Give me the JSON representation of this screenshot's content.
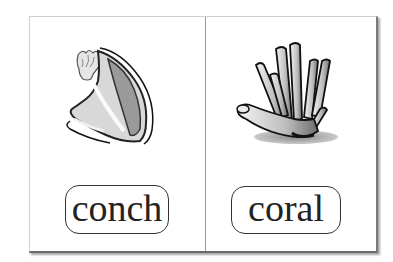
{
  "cards": [
    {
      "word": "conch",
      "illustration": "conch-shell"
    },
    {
      "word": "coral",
      "illustration": "coral"
    }
  ],
  "colors": {
    "border_light": "#cfcfcf",
    "border_dark": "#6a6a6a",
    "text": "#222222",
    "divider": "#9a9a9a"
  }
}
